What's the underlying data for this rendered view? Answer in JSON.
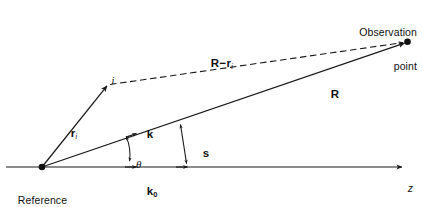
{
  "figure": {
    "background_color": "#ffffff",
    "line_color": "#1a1a1a",
    "text_color": "#111111",
    "width": 423,
    "height": 207
  },
  "labels": {
    "observation_point_line1": "Observation",
    "observation_point_line2": "point",
    "reference_point_line1": "Reference",
    "reference_point_line2": "point",
    "vector_R": "R",
    "vector_r_i_base": "r",
    "vector_r_i_sub": "i",
    "index_i": "i",
    "difference_R_base": "R",
    "difference_minus": "−",
    "difference_r_base": "r",
    "difference_r_sub": "i",
    "vector_k": "k",
    "vector_k0_base": "k",
    "vector_k0_sub": "0",
    "vector_s": "s",
    "angle_theta": "θ",
    "axis_z": "z"
  },
  "geometry": {
    "origin": {
      "x": 42,
      "y": 167
    },
    "observation_point": {
      "x": 407,
      "y": 42
    },
    "scatterer_i": {
      "x": 108,
      "y": 85
    },
    "z_axis_tip": {
      "x": 405,
      "y": 167
    },
    "k_arrow_on_R": {
      "x": 135,
      "y": 134
    },
    "k0_arrow_on_z": {
      "x": 135,
      "y": 167
    },
    "s_top": {
      "x": 180,
      "y": 122
    },
    "s_bottom": {
      "x": 187,
      "y": 167
    },
    "theta_arc_radius": 46
  }
}
